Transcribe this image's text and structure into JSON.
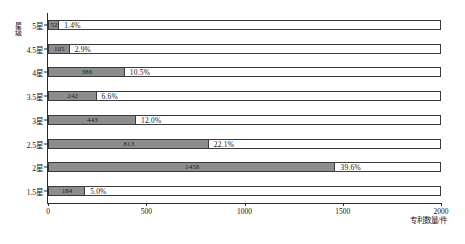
{
  "chart_data": {
    "type": "bar",
    "orientation": "horizontal",
    "title": "",
    "xlabel": "专利数量/件",
    "ylabel": "星级",
    "categories": [
      "5星",
      "4.5星",
      "4星",
      "3.5星",
      "3星",
      "2.5星",
      "2星",
      "1.5星"
    ],
    "values": [
      52,
      105,
      386,
      242,
      443,
      813,
      1458,
      184
    ],
    "value_labels": [
      "52",
      "105",
      "386",
      "242",
      "443",
      "813",
      "1458",
      "184"
    ],
    "percent_labels": [
      "1.4%",
      "2.9%",
      "10.5%",
      "6.6%",
      "12.0%",
      "22.1%",
      "39.6%",
      "5.0%"
    ],
    "percents": [
      1.4,
      2.9,
      10.5,
      6.6,
      12.0,
      22.1,
      39.6,
      5.0
    ],
    "xlim": [
      0,
      2000
    ],
    "xticks": [
      0,
      500,
      1000,
      1500,
      2000
    ],
    "xtick_labels": [
      "0",
      "500",
      "1000",
      "1500",
      "2000"
    ],
    "grid": false,
    "legend": "none",
    "bar_color": "#8d8d8d",
    "bar_outline_color": "#3a3a3a",
    "frame_background": "#ffffff"
  },
  "caption": {
    "text": ""
  }
}
